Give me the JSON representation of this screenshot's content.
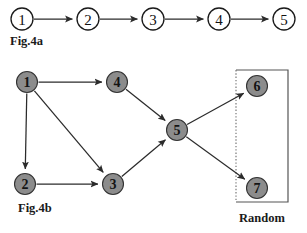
{
  "figure": {
    "background_color": "#ffffff",
    "width": 307,
    "height": 233,
    "edge_color": "#2b2b2b",
    "open_node_fill": "#ffffff",
    "open_node_stroke": "#1a1a1a",
    "filled_node_fill": "#8c8c8c",
    "filled_node_stroke": "#333333",
    "group_box_stroke": "#555555",
    "group_box_dotted_stroke": "#777777"
  },
  "panel_a": {
    "caption": "Fig.4a",
    "caption_x": 10,
    "caption_y": 45,
    "node_radius": 11,
    "node_style": "open",
    "nodes": [
      {
        "id": "a1",
        "label": "1",
        "x": 22,
        "y": 19
      },
      {
        "id": "a2",
        "label": "2",
        "x": 88,
        "y": 19
      },
      {
        "id": "a3",
        "label": "3",
        "x": 153,
        "y": 19
      },
      {
        "id": "a4",
        "label": "4",
        "x": 219,
        "y": 19
      },
      {
        "id": "a5",
        "label": "5",
        "x": 284,
        "y": 19
      }
    ],
    "edges": [
      {
        "from": "a1",
        "to": "a2",
        "directed": true
      },
      {
        "from": "a2",
        "to": "a3",
        "directed": true
      },
      {
        "from": "a3",
        "to": "a4",
        "directed": true
      },
      {
        "from": "a4",
        "to": "a5",
        "directed": true
      }
    ]
  },
  "panel_b": {
    "caption": "Fig.4b",
    "caption_x": 18,
    "caption_y": 212,
    "node_radius": 10.5,
    "node_style": "filled",
    "nodes": [
      {
        "id": "b1",
        "label": "1",
        "x": 27,
        "y": 82
      },
      {
        "id": "b2",
        "label": "2",
        "x": 25,
        "y": 184
      },
      {
        "id": "b3",
        "label": "3",
        "x": 113,
        "y": 184
      },
      {
        "id": "b4",
        "label": "4",
        "x": 117,
        "y": 82
      },
      {
        "id": "b5",
        "label": "5",
        "x": 177,
        "y": 130
      },
      {
        "id": "b6",
        "label": "6",
        "x": 257,
        "y": 86
      },
      {
        "id": "b7",
        "label": "7",
        "x": 257,
        "y": 188
      }
    ],
    "edges": [
      {
        "from": "b1",
        "to": "b4",
        "directed": true
      },
      {
        "from": "b1",
        "to": "b2",
        "directed": true
      },
      {
        "from": "b1",
        "to": "b3",
        "directed": true
      },
      {
        "from": "b2",
        "to": "b3",
        "directed": true
      },
      {
        "from": "b4",
        "to": "b5",
        "directed": true
      },
      {
        "from": "b3",
        "to": "b5",
        "directed": true
      },
      {
        "from": "b5",
        "to": "b6",
        "directed": true
      },
      {
        "from": "b5",
        "to": "b7",
        "directed": true
      }
    ],
    "group_box": {
      "label": "Random",
      "label_x": 262,
      "label_y": 222,
      "x": 236,
      "y": 70,
      "width": 52,
      "height": 132,
      "left_edge_style": "dotted"
    }
  }
}
